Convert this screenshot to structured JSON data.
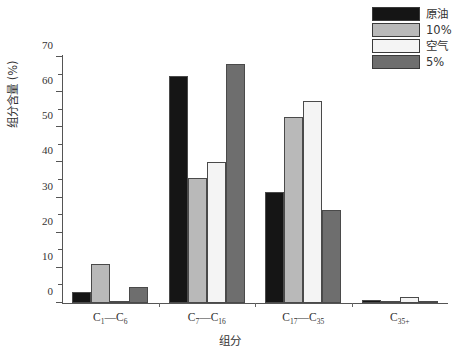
{
  "chart_data": {
    "type": "bar",
    "title": "",
    "xlabel": "组分",
    "ylabel": "组分含量 (%)",
    "ylim": [
      0,
      70
    ],
    "ytick_step": 10,
    "yminor_step": 5,
    "grid": false,
    "legend_position": "top-right",
    "categories": [
      "C₁—C₆",
      "C₇—C₁₆",
      "C₁₇—C₃₅",
      "C₃₅₊"
    ],
    "categories_parts": [
      {
        "a": "C",
        "asub": "1",
        "dash": "—",
        "b": "C",
        "bsub": "6"
      },
      {
        "a": "C",
        "asub": "7",
        "dash": "—",
        "b": "C",
        "bsub": "16"
      },
      {
        "a": "C",
        "asub": "17",
        "dash": "—",
        "b": "C",
        "bsub": "35"
      },
      {
        "a": "C",
        "asub": "35+",
        "dash": "",
        "b": "",
        "bsub": ""
      }
    ],
    "ytick_labels": [
      "0",
      "10",
      "20",
      "30",
      "40",
      "50",
      "60",
      "70"
    ],
    "series": [
      {
        "name": "原油",
        "color": "#151515",
        "values": [
          3.0,
          64.5,
          31.5,
          1.0
        ]
      },
      {
        "name": "10%",
        "color": "#b9b9b9",
        "values": [
          11.0,
          35.5,
          53.0,
          0.4
        ]
      },
      {
        "name": "空气",
        "color": "#f4f4f4",
        "values": [
          0.5,
          40.0,
          57.5,
          1.6
        ]
      },
      {
        "name": "5%",
        "color": "#6e6e6e",
        "values": [
          4.5,
          68.0,
          26.5,
          0.3
        ]
      }
    ]
  },
  "legend": {
    "items": [
      {
        "label": "原油",
        "color": "#151515"
      },
      {
        "label": "10%",
        "color": "#b9b9b9"
      },
      {
        "label": "空气",
        "color": "#f4f4f4"
      },
      {
        "label": "5%",
        "color": "#6e6e6e"
      }
    ]
  }
}
